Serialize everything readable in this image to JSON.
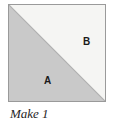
{
  "figure": {
    "caption": "Make 1",
    "shape": "square",
    "pieces": [
      {
        "id": "A",
        "label": "A",
        "position": "lower-left",
        "fill_color": "#c9c9c9",
        "description": "shaded triangle"
      },
      {
        "id": "B",
        "label": "B",
        "position": "upper-right",
        "fill_color": "#f5f5f3",
        "description": "light triangle"
      }
    ],
    "colors": {
      "background": "#ffffff",
      "border": "#9a9a9a",
      "diagonal": "#b0b0b0",
      "piece_a_fill": "#c9c9c9",
      "piece_b_fill": "#f5f5f3",
      "label_text": "#1a1a1a",
      "caption_text": "#262626"
    }
  }
}
